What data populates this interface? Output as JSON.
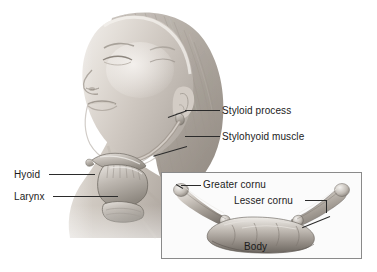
{
  "figure": {
    "background_color": "#ffffff",
    "label_color": "#1b1b1b",
    "leader_color": "#2b2b2b",
    "inset_border_color": "#8a8a8a"
  },
  "main_image": {
    "subject": "woman-head-tilted-back-lateral-view",
    "description": "Grayscale photograph of a woman's head tilted back with braided hair, showing neck anatomy",
    "skin_tone": "#d8d3cd",
    "hair_tone": "#b9b3ad"
  },
  "callouts": {
    "right": [
      {
        "label": "Styloid process",
        "x": 222,
        "y": 106
      },
      {
        "label": "Stylohyoid muscle",
        "x": 222,
        "y": 132
      }
    ],
    "left": [
      {
        "label": "Hyoid",
        "x": 14,
        "y": 169
      },
      {
        "label": "Larynx",
        "x": 14,
        "y": 191
      }
    ]
  },
  "inset": {
    "caption_greater": "Greater cornu",
    "caption_lesser": "Lesser cornu",
    "caption_body": "Body",
    "bone": "hyoid-bone-superior-view",
    "bone_description": "U-shaped hyoid bone seen from above with upturned greater cornua at each end"
  }
}
